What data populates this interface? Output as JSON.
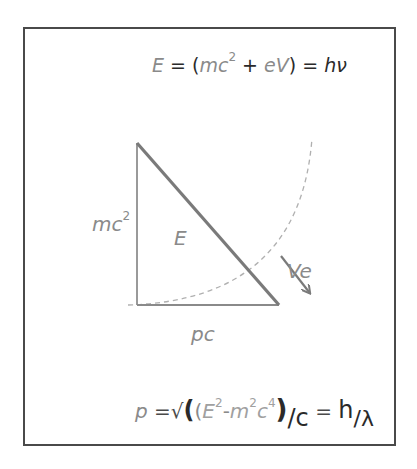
{
  "diagram": {
    "top_equation": {
      "E": "E",
      "eq1": " = (",
      "mc": "mc",
      "sup2": "2",
      "plus": " + ",
      "eV": "eV",
      "close": ") = ",
      "h": "h",
      "nu": "ν"
    },
    "labels": {
      "mc2_base": "mc",
      "mc2_sup": "2",
      "E": "E",
      "Ve": "Ve",
      "pc": "pc"
    },
    "bottom_equation": {
      "p": "p",
      "eq_sqrt": " =√",
      "big_open": "(",
      "open": "(",
      "E": "E",
      "E_sup": "2",
      "minus": "-",
      "m": "m",
      "m_sup": "2",
      "c": "c",
      "c_sup": "4",
      "close": ")",
      "slash_c": "/c",
      "equals": " = ",
      "h": "h",
      "slash_lambda": "/λ"
    },
    "colors": {
      "border": "#4a4a4a",
      "triangle_stroke": "#8a8a8a",
      "hypotenuse": "#7a7a7a",
      "dashed_arc": "#b0b0b0",
      "text_gray": "#8a8a8a",
      "text_dark": "#2a2a2a"
    }
  }
}
